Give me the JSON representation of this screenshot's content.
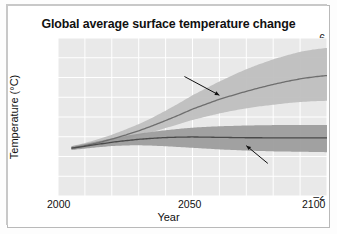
{
  "chart_data": {
    "type": "area",
    "title": "Global average surface temperature change",
    "xlabel": "Year",
    "ylabel": "Temperature (°C)",
    "xlim": [
      2000,
      2100
    ],
    "ylim": [
      -2,
      6
    ],
    "yticks": [
      6,
      4,
      2,
      0,
      -2
    ],
    "ytick_labels": [
      "6",
      "4",
      "2",
      "0",
      "–2"
    ],
    "xticks": [
      2000,
      2050,
      2100
    ],
    "xtick_labels": [
      "2000",
      "2050",
      "2100"
    ],
    "grid": true,
    "grid_color": "#ffffff",
    "plot_background": "#e9e9e9",
    "legend_position": "inline-annotations",
    "annotations": [
      {
        "name": "highest-emission-annotation",
        "text": "Highest-emission scenario",
        "points_to_year": 2060,
        "points_to_value": 3.1
      },
      {
        "name": "lowest-emission-annotation",
        "text": "Lowest-emission scenario",
        "points_to_year": 2070,
        "points_to_value": 0.55
      }
    ],
    "x": [
      2000,
      2005,
      2010,
      2015,
      2020,
      2025,
      2030,
      2035,
      2040,
      2045,
      2050,
      2055,
      2060,
      2065,
      2070,
      2075,
      2080,
      2085,
      2090,
      2095,
      2100
    ],
    "series": [
      {
        "name": "Highest-emission scenario",
        "color": "#6e6e6e",
        "band_color": "#bdbdbd",
        "mean": [
          0.35,
          0.42,
          0.55,
          0.7,
          0.88,
          1.08,
          1.3,
          1.55,
          1.82,
          2.1,
          2.4,
          2.65,
          2.9,
          3.1,
          3.3,
          3.48,
          3.65,
          3.8,
          3.93,
          4.03,
          4.1
        ],
        "lower": [
          0.28,
          0.34,
          0.44,
          0.57,
          0.72,
          0.88,
          1.05,
          1.24,
          1.44,
          1.64,
          1.85,
          2.02,
          2.18,
          2.32,
          2.44,
          2.54,
          2.62,
          2.7,
          2.76,
          2.8,
          2.82
        ],
        "upper": [
          0.42,
          0.52,
          0.68,
          0.88,
          1.1,
          1.36,
          1.64,
          1.96,
          2.32,
          2.7,
          3.1,
          3.45,
          3.8,
          4.12,
          4.42,
          4.68,
          4.92,
          5.12,
          5.3,
          5.42,
          5.5
        ]
      },
      {
        "name": "Lowest-emission scenario",
        "color": "#4a4a4a",
        "band_color": "#9a9a9a",
        "mean": [
          0.35,
          0.42,
          0.52,
          0.62,
          0.72,
          0.8,
          0.87,
          0.92,
          0.96,
          0.98,
          0.99,
          0.98,
          0.97,
          0.96,
          0.95,
          0.95,
          0.94,
          0.94,
          0.94,
          0.94,
          0.94
        ],
        "lower": [
          0.28,
          0.33,
          0.4,
          0.47,
          0.53,
          0.56,
          0.57,
          0.55,
          0.52,
          0.48,
          0.44,
          0.4,
          0.36,
          0.33,
          0.3,
          0.28,
          0.26,
          0.25,
          0.24,
          0.23,
          0.22
        ],
        "upper": [
          0.42,
          0.51,
          0.64,
          0.78,
          0.92,
          1.04,
          1.15,
          1.25,
          1.33,
          1.4,
          1.46,
          1.5,
          1.53,
          1.55,
          1.57,
          1.58,
          1.59,
          1.6,
          1.6,
          1.6,
          1.6
        ]
      }
    ]
  }
}
